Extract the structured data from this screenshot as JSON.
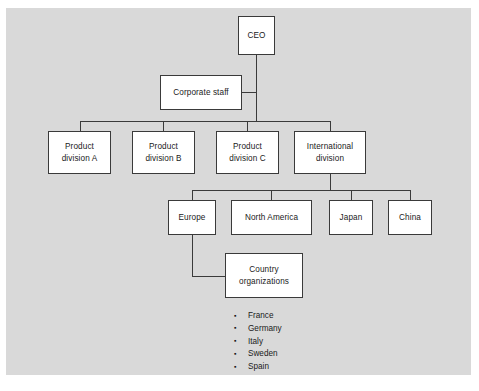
{
  "diagram": {
    "type": "organizational-chart",
    "background_color": "#d9d9d9",
    "node_fill_color": "#ffffff",
    "line_color": "#3a3a3a",
    "text_color": "#1a1a1a",
    "levels": [
      {
        "level": 1,
        "nodes": [
          {
            "id": "ceo",
            "label": "CEO"
          }
        ]
      },
      {
        "level": 2,
        "nodes": [
          {
            "id": "corporate-staff",
            "label": "Corporate staff"
          }
        ]
      },
      {
        "level": 3,
        "nodes": [
          {
            "id": "product-division-a",
            "label": "Product\ndivision A"
          },
          {
            "id": "product-division-b",
            "label": "Product\ndivision B"
          },
          {
            "id": "product-division-c",
            "label": "Product\ndivision C"
          },
          {
            "id": "international-division",
            "label": "International\ndivision"
          }
        ]
      },
      {
        "level": 4,
        "nodes": [
          {
            "id": "europe",
            "label": "Europe"
          },
          {
            "id": "north-america",
            "label": "North America"
          },
          {
            "id": "japan",
            "label": "Japan"
          },
          {
            "id": "china",
            "label": "China"
          }
        ]
      },
      {
        "level": 5,
        "nodes": [
          {
            "id": "country-organizations",
            "label": "Country\norganizations"
          }
        ]
      }
    ],
    "edges": [
      {
        "from": "ceo",
        "to": "corporate-staff"
      },
      {
        "from": "ceo",
        "to": "product-division-a"
      },
      {
        "from": "ceo",
        "to": "product-division-b"
      },
      {
        "from": "ceo",
        "to": "product-division-c"
      },
      {
        "from": "ceo",
        "to": "international-division"
      },
      {
        "from": "international-division",
        "to": "europe"
      },
      {
        "from": "international-division",
        "to": "north-america"
      },
      {
        "from": "international-division",
        "to": "japan"
      },
      {
        "from": "international-division",
        "to": "china"
      },
      {
        "from": "europe",
        "to": "country-organizations"
      }
    ],
    "nodes": {
      "ceo": "CEO",
      "corporate_staff": "Corporate staff",
      "product_division_a": "Product\ndivision A",
      "product_division_b": "Product\ndivision B",
      "product_division_c": "Product\ndivision C",
      "international_division": "International\ndivision",
      "europe": "Europe",
      "north_america": "North America",
      "japan": "Japan",
      "china": "China",
      "country_organizations": "Country\norganizations"
    },
    "country_list": [
      "France",
      "Germany",
      "Italy",
      "Sweden",
      "Spain"
    ]
  }
}
